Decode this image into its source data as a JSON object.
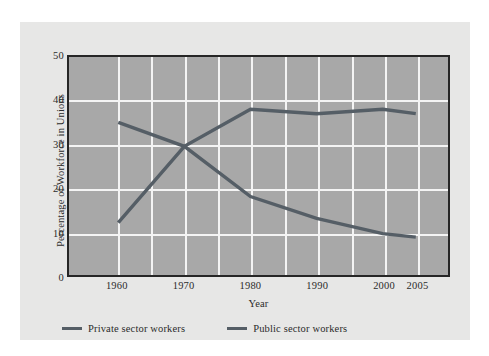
{
  "chart_data": {
    "type": "line",
    "title": "",
    "xlabel": "Year",
    "ylabel": "Percentage of Workforce in Unions",
    "x": [
      1960,
      1970,
      1980,
      1990,
      2000,
      2005
    ],
    "xtick_labels": [
      "1960",
      "1970",
      "1980",
      "1990",
      "2000",
      "2005"
    ],
    "ytick_labels": [
      "0",
      "10",
      "20",
      "30",
      "40",
      "50"
    ],
    "yticks": [
      0,
      10,
      20,
      30,
      40,
      50
    ],
    "ylim": [
      0,
      50
    ],
    "grid": true,
    "legend_position": "below-axes",
    "series": [
      {
        "name": "Private sector workers",
        "color": "#555e66",
        "values": [
          35.0,
          29.5,
          18.0,
          13.0,
          9.5,
          8.7
        ]
      },
      {
        "name": "Public sector workers",
        "color": "#555e66",
        "values": [
          12.0,
          29.5,
          38.0,
          37.0,
          38.0,
          37.0
        ]
      }
    ]
  },
  "figure": {
    "background_color": "#e7e7e6",
    "plot_background_color": "#a8a8a8",
    "gridline_color": "#f4f4f4",
    "axis_border_color": "#262626",
    "text_color": "#2b2b2b"
  },
  "legend": {
    "entries": [
      {
        "label": "Private sector workers",
        "swatch_color": "#555e66"
      },
      {
        "label": "Public sector workers",
        "swatch_color": "#555e66"
      }
    ]
  }
}
